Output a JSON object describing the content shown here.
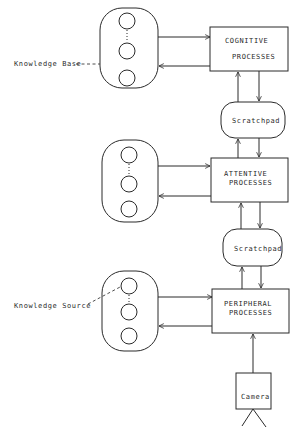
{
  "diagram": {
    "type": "block-diagram",
    "processes": [
      {
        "id": "cognitive",
        "line1": "COGNITIVE",
        "line2": "PROCESSES"
      },
      {
        "id": "attentive",
        "line1": "ATTENTIVE",
        "line2": "PROCESSES"
      },
      {
        "id": "peripheral",
        "line1": "PERIPHERAL",
        "line2": "PROCESSES"
      }
    ],
    "scratchpads": [
      {
        "id": "scratchpad-1",
        "label": "Scratchpad"
      },
      {
        "id": "scratchpad-2",
        "label": "Scratchpad"
      }
    ],
    "knowledge_bases": [
      {
        "id": "kb-top",
        "circles": 3
      },
      {
        "id": "kb-middle",
        "circles": 3
      },
      {
        "id": "kb-bottom",
        "circles": 3
      }
    ],
    "annotations": {
      "knowledge_base": "Knowledge Base",
      "knowledge_source": "Knowledge Source"
    },
    "sensor": {
      "label": "Camera"
    },
    "colors": {
      "line": "#2a2a2a",
      "background": "#ffffff"
    }
  }
}
